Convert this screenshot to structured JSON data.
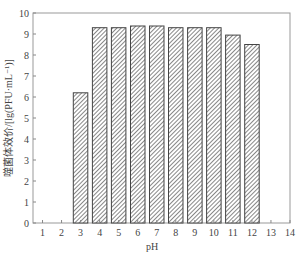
{
  "chart_data": {
    "type": "bar",
    "title": "",
    "xlabel": "pH",
    "ylabel": "噬菌体效价/[lg(PFU·mL⁻¹)]",
    "categories": [
      "3",
      "4",
      "5",
      "6",
      "7",
      "8",
      "9",
      "10",
      "11",
      "12"
    ],
    "values": [
      6.2,
      9.3,
      9.3,
      9.38,
      9.38,
      9.3,
      9.3,
      9.3,
      8.95,
      8.5
    ],
    "x_ticks": [
      1,
      2,
      3,
      4,
      5,
      6,
      7,
      8,
      9,
      10,
      11,
      12,
      13,
      14
    ],
    "y_ticks": [
      0,
      1,
      2,
      3,
      4,
      5,
      6,
      7,
      8,
      9,
      10
    ],
    "xlim": [
      0.5,
      14
    ],
    "ylim": [
      0,
      10
    ],
    "grid": false,
    "bar_fill": "hatched",
    "colors": {
      "bar_edge": "#444444",
      "hatch": "#555555",
      "axis": "#888888"
    }
  }
}
